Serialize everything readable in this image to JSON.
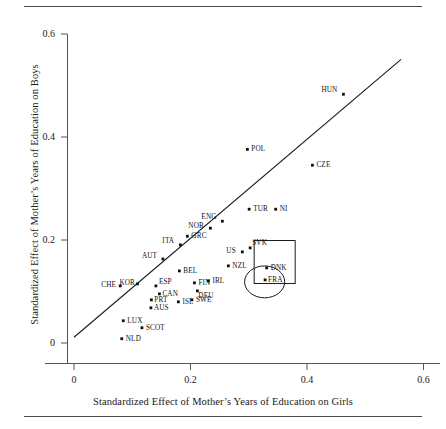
{
  "figure": {
    "top_rule": "",
    "bottom_rule": ""
  },
  "chart_data": {
    "type": "scatter",
    "title": "",
    "xlabel": "Standardized Effect of Mother’s Years of Education on Girls",
    "ylabel": "Standardized Effect of Mother’s Years of Education on Boys",
    "xlim": [
      -0.0275,
      0.6375
    ],
    "ylim": [
      -0.0215,
      0.6405
    ],
    "xticks": [
      0,
      0.2,
      0.4,
      0.6
    ],
    "xtick_labels": [
      "0",
      "0.2",
      "0.4",
      "0.6"
    ],
    "yticks": [
      0,
      0.2,
      0.4,
      0.6
    ],
    "ytick_labels": [
      "0",
      "0.2",
      "0.4",
      "0.6"
    ],
    "grid": false,
    "legend": null,
    "marker": "filled-square",
    "fit_line": {
      "label": "45-degree reference line",
      "x0": 0.0,
      "y0": 0.0112,
      "x1": 0.5615,
      "y1": 0.5506,
      "style": "solid"
    },
    "annotations": [
      {
        "name": "rect-highlight-DNK",
        "shape": "rectangle",
        "x": 0.3093,
        "y": 0.1155,
        "w": 0.0704,
        "h": 0.0835
      },
      {
        "name": "ellipse-highlight-FRA",
        "shape": "ellipse",
        "x": 0.3273,
        "y": 0.1187,
        "rx": 0.0344,
        "ry": 0.031
      }
    ],
    "points": [
      {
        "label": "HUN",
        "x": 0.4625,
        "y": 0.483,
        "lx": -22,
        "ly": -4
      },
      {
        "label": "POL",
        "x": 0.2976,
        "y": 0.376,
        "lx": 4,
        "ly": 0
      },
      {
        "label": "CZE",
        "x": 0.4093,
        "y": 0.3452,
        "lx": 4,
        "ly": 0
      },
      {
        "label": "TUR",
        "x": 0.3007,
        "y": 0.2598,
        "lx": 4,
        "ly": 0
      },
      {
        "label": "NI",
        "x": 0.3462,
        "y": 0.2598,
        "lx": 4,
        "ly": 0
      },
      {
        "label": "ENG",
        "x": 0.2547,
        "y": 0.2365,
        "lx": -21,
        "ly": -4
      },
      {
        "label": "NOR",
        "x": 0.2341,
        "y": 0.2229,
        "lx": -22,
        "ly": -2
      },
      {
        "label": "GRC",
        "x": 0.1946,
        "y": 0.2073,
        "lx": 4,
        "ly": 0
      },
      {
        "label": "ITA",
        "x": 0.1826,
        "y": 0.1905,
        "lx": -18,
        "ly": -4
      },
      {
        "label": "SVK",
        "x": 0.3024,
        "y": 0.1847,
        "lx": 2,
        "ly": -5
      },
      {
        "label": "US",
        "x": 0.289,
        "y": 0.1769,
        "lx": -16,
        "ly": -1
      },
      {
        "label": "AUT",
        "x": 0.1526,
        "y": 0.1632,
        "lx": -21,
        "ly": -3
      },
      {
        "label": "NZL",
        "x": 0.265,
        "y": 0.1498,
        "lx": 4,
        "ly": 0
      },
      {
        "label": "DNK",
        "x": 0.3308,
        "y": 0.1459,
        "lx": 4,
        "ly": 0
      },
      {
        "label": "BEL",
        "x": 0.1809,
        "y": 0.14,
        "lx": 4,
        "ly": 0
      },
      {
        "label": "FRA",
        "x": 0.3281,
        "y": 0.1225,
        "lx": 3,
        "ly": 0
      },
      {
        "label": "IRL",
        "x": 0.2307,
        "y": 0.1206,
        "lx": 4,
        "ly": 0
      },
      {
        "label": "FIN",
        "x": 0.2067,
        "y": 0.1167,
        "lx": 4,
        "ly": 0
      },
      {
        "label": "KOR",
        "x": 0.1089,
        "y": 0.1148,
        "lx": -18,
        "ly": -1
      },
      {
        "label": "ESP",
        "x": 0.1406,
        "y": 0.1109,
        "lx": 3,
        "ly": -4
      },
      {
        "label": "CHE",
        "x": 0.0794,
        "y": 0.1109,
        "lx": -19,
        "ly": -1
      },
      {
        "label": "DEU",
        "x": 0.2118,
        "y": 0.1012,
        "lx": 1,
        "ly": 5
      },
      {
        "label": "CAN",
        "x": 0.1466,
        "y": 0.0954,
        "lx": 3,
        "ly": 0
      },
      {
        "label": "SWE",
        "x": 0.2024,
        "y": 0.0838,
        "lx": 4,
        "ly": 0
      },
      {
        "label": "PRT",
        "x": 0.1328,
        "y": 0.0838,
        "lx": 3,
        "ly": 0
      },
      {
        "label": "ISL",
        "x": 0.1792,
        "y": 0.0799,
        "lx": 4,
        "ly": 0
      },
      {
        "label": "AUS",
        "x": 0.132,
        "y": 0.0683,
        "lx": 3,
        "ly": 0
      },
      {
        "label": "LUX",
        "x": 0.0846,
        "y": 0.0432,
        "lx": 4,
        "ly": 0
      },
      {
        "label": "SCOT",
        "x": 0.1166,
        "y": 0.0296,
        "lx": 4,
        "ly": 0
      },
      {
        "label": "NLD",
        "x": 0.082,
        "y": 0.0083,
        "lx": 4,
        "ly": 0
      }
    ]
  }
}
